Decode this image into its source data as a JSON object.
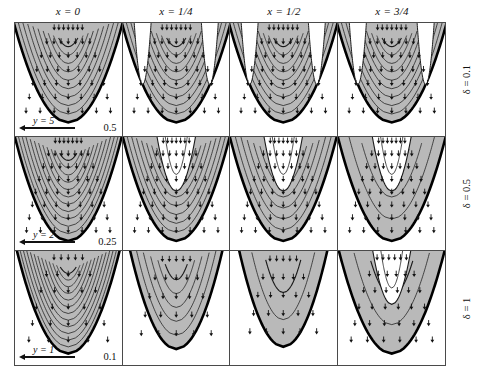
{
  "figure": {
    "title": "",
    "background_color": "#ffffff",
    "frame_color": "#4a4a4a"
  },
  "columns": [
    {
      "id": "col-x-0",
      "label": "x = 0",
      "x_value": "0"
    },
    {
      "id": "col-x-1-4",
      "label": "x = 1/4",
      "x_value": "1/4"
    },
    {
      "id": "col-x-1-2",
      "label": "x = 1/2",
      "x_value": "1/2"
    },
    {
      "id": "col-x-3-4",
      "label": "x = 3/4",
      "x_value": "3/4"
    }
  ],
  "rows": [
    {
      "id": "row-delta-0-1",
      "label": "δ = 0.1",
      "delta": 0.1,
      "scale_label": "y = 5",
      "magnitude_label": "0.5"
    },
    {
      "id": "row-delta-0-5",
      "label": "δ = 0.5",
      "delta": 0.5,
      "scale_label": "y = 2",
      "magnitude_label": "0.25"
    },
    {
      "id": "row-delta-1",
      "label": "δ = 1",
      "delta": 1.0,
      "scale_label": "y = 1",
      "magnitude_label": "0.1"
    }
  ],
  "chart_data": {
    "type": "line",
    "title": "",
    "subtitle": "",
    "xlabel": "",
    "ylabel": "",
    "grid": false,
    "legend_position": "none",
    "panel_layout": {
      "rows": 3,
      "cols": 4
    },
    "shading": {
      "filled_color": "#b9b9b9",
      "empty_color": "#ffffff",
      "contour_color": "#1a1a1a",
      "boundary_color": "#000000"
    },
    "column_values": [
      "0",
      "1/4",
      "1/2",
      "3/4"
    ],
    "row_values": [
      0.1,
      0.5,
      1
    ],
    "scale_bars": [
      {
        "row": 0,
        "length_label": "y = 5",
        "vector_magnitude": "0.5"
      },
      {
        "row": 1,
        "length_label": "y = 2",
        "vector_magnitude": "0.25"
      },
      {
        "row": 2,
        "length_label": "y = 1",
        "vector_magnitude": "0.1"
      }
    ],
    "panels": [
      {
        "row": 0,
        "col": 0,
        "delta": 0.1,
        "x": "0",
        "n_contours": 9,
        "core_filled": true,
        "white_lobes": 0,
        "arrow_rows": 7,
        "arrow_cols": 7,
        "arrow_direction": "converging-downward",
        "parabola_width": 0.94,
        "parabola_depth": 0.88
      },
      {
        "row": 0,
        "col": 1,
        "delta": 0.1,
        "x": "1/4",
        "n_contours": 9,
        "core_filled": true,
        "white_lobes": 2,
        "arrow_rows": 7,
        "arrow_cols": 7,
        "arrow_direction": "converging-downward",
        "parabola_width": 0.94,
        "parabola_depth": 0.88
      },
      {
        "row": 0,
        "col": 2,
        "delta": 0.1,
        "x": "1/2",
        "n_contours": 9,
        "core_filled": true,
        "white_lobes": 2,
        "arrow_rows": 7,
        "arrow_cols": 7,
        "arrow_direction": "converging-downward",
        "parabola_width": 0.94,
        "parabola_depth": 0.88
      },
      {
        "row": 0,
        "col": 3,
        "delta": 0.1,
        "x": "3/4",
        "n_contours": 9,
        "core_filled": true,
        "white_lobes": 2,
        "arrow_rows": 7,
        "arrow_cols": 7,
        "arrow_direction": "converging-downward",
        "parabola_width": 0.94,
        "parabola_depth": 0.88
      },
      {
        "row": 1,
        "col": 0,
        "delta": 0.5,
        "x": "0",
        "n_contours": 11,
        "core_filled": true,
        "white_lobes": 0,
        "arrow_rows": 8,
        "arrow_cols": 7,
        "arrow_direction": "downward",
        "parabola_width": 0.92,
        "parabola_depth": 0.92
      },
      {
        "row": 1,
        "col": 1,
        "delta": 0.5,
        "x": "1/4",
        "n_contours": 9,
        "core_filled": true,
        "white_lobes": 1,
        "arrow_rows": 8,
        "arrow_cols": 7,
        "arrow_direction": "downward",
        "parabola_width": 0.92,
        "parabola_depth": 0.92
      },
      {
        "row": 1,
        "col": 2,
        "delta": 0.5,
        "x": "1/2",
        "n_contours": 7,
        "core_filled": true,
        "white_lobes": 1,
        "arrow_rows": 8,
        "arrow_cols": 7,
        "arrow_direction": "downward",
        "parabola_width": 0.92,
        "parabola_depth": 0.92
      },
      {
        "row": 1,
        "col": 3,
        "delta": 0.5,
        "x": "3/4",
        "n_contours": 3,
        "core_filled": true,
        "white_lobes": 1,
        "arrow_rows": 8,
        "arrow_cols": 7,
        "arrow_direction": "downward",
        "parabola_width": 0.92,
        "parabola_depth": 0.92
      },
      {
        "row": 2,
        "col": 0,
        "delta": 1,
        "x": "0",
        "n_contours": 12,
        "core_filled": true,
        "white_lobes": 0,
        "arrow_rows": 6,
        "arrow_cols": 5,
        "arrow_direction": "downward",
        "parabola_width": 0.88,
        "parabola_depth": 0.9
      },
      {
        "row": 2,
        "col": 1,
        "delta": 1,
        "x": "1/4",
        "n_contours": 5,
        "core_filled": true,
        "white_lobes": 0,
        "arrow_rows": 5,
        "arrow_cols": 5,
        "arrow_direction": "downward",
        "parabola_width": 0.78,
        "parabola_depth": 0.86
      },
      {
        "row": 2,
        "col": 2,
        "delta": 1,
        "x": "1/2",
        "n_contours": 2,
        "core_filled": true,
        "white_lobes": 0,
        "arrow_rows": 5,
        "arrow_cols": 5,
        "arrow_direction": "downward",
        "parabola_width": 0.74,
        "parabola_depth": 0.84
      },
      {
        "row": 2,
        "col": 3,
        "delta": 1,
        "x": "3/4",
        "n_contours": 2,
        "core_filled": true,
        "white_lobes": 1,
        "arrow_rows": 6,
        "arrow_cols": 6,
        "arrow_direction": "downward",
        "parabola_width": 0.9,
        "parabola_depth": 0.9
      }
    ]
  }
}
